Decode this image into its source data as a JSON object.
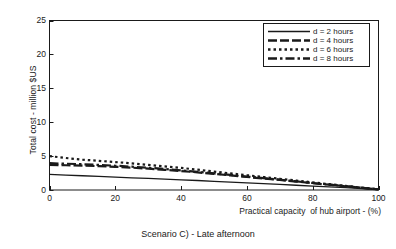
{
  "chart_data": {
    "type": "line",
    "title": "",
    "caption": "Scenario C) - Late afternoon",
    "xlabel": "Practical capacity  of hub airport - (%)",
    "ylabel": "Total cost - million $US",
    "xlim": [
      0,
      100
    ],
    "ylim": [
      0,
      25
    ],
    "xticks": [
      0,
      20,
      40,
      60,
      80,
      100
    ],
    "yticks": [
      0,
      5,
      10,
      15,
      20,
      25
    ],
    "xtick_labels": [
      "0",
      "20",
      "40",
      "60",
      "80",
      "100"
    ],
    "ytick_labels": [
      "0",
      "5",
      "10",
      "15",
      "20",
      "25"
    ],
    "grid": false,
    "legend_position": "top-right",
    "x": [
      0,
      5,
      10,
      15,
      20,
      25,
      30,
      35,
      40,
      45,
      50,
      55,
      60,
      65,
      70,
      75,
      80,
      85,
      90,
      95,
      100
    ],
    "series": [
      {
        "name": "d = 2 hours",
        "label": "d = 2 hours",
        "linestyle": "solid",
        "color": "#1a1a1a",
        "values": [
          2.3,
          2.2,
          2.1,
          2.0,
          1.9,
          1.8,
          1.7,
          1.6,
          1.5,
          1.4,
          1.28,
          1.17,
          1.05,
          0.94,
          0.82,
          0.7,
          0.58,
          0.46,
          0.34,
          0.2,
          0.05
        ]
      },
      {
        "name": "d = 4 hours",
        "label": "d = 4 hours",
        "linestyle": "dashed",
        "color": "#1a1a1a",
        "values": [
          3.7,
          3.65,
          3.6,
          3.52,
          3.42,
          3.3,
          3.15,
          2.98,
          2.8,
          2.6,
          2.38,
          2.15,
          1.92,
          1.7,
          1.48,
          1.25,
          1.0,
          0.78,
          0.55,
          0.32,
          0.08
        ]
      },
      {
        "name": "d = 6 hours",
        "label": "d = 6 hours",
        "linestyle": "dotted",
        "color": "#1a1a1a",
        "values": [
          5.0,
          4.72,
          4.48,
          4.3,
          4.12,
          3.92,
          3.7,
          3.48,
          3.25,
          3.0,
          2.72,
          2.45,
          2.18,
          1.92,
          1.66,
          1.4,
          1.12,
          0.86,
          0.6,
          0.35,
          0.1
        ]
      },
      {
        "name": "d = 8 hours",
        "label": "d = 8 hours",
        "linestyle": "dashdot",
        "color": "#1a1a1a",
        "values": [
          3.95,
          3.88,
          3.8,
          3.7,
          3.58,
          3.44,
          3.28,
          3.1,
          2.9,
          2.68,
          2.45,
          2.22,
          1.98,
          1.75,
          1.52,
          1.28,
          1.03,
          0.8,
          0.57,
          0.33,
          0.08
        ]
      }
    ]
  },
  "axes": {
    "frame_color": "#1a1a1a"
  }
}
